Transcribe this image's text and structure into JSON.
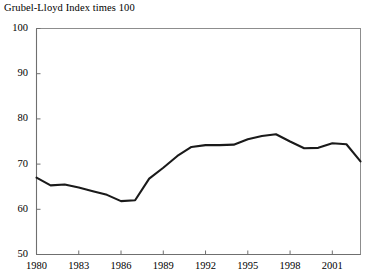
{
  "chart_data": {
    "type": "line",
    "title": "Grubel-Lloyd Index times 100",
    "xlabel": "",
    "ylabel": "",
    "grid": false,
    "legend": "none",
    "xlim": [
      1980,
      2003
    ],
    "ylim": [
      50,
      100
    ],
    "y_ticks": [
      50,
      60,
      70,
      80,
      90,
      100
    ],
    "y_tick_labels": [
      "50",
      "60",
      "70",
      "80",
      "90",
      "100"
    ],
    "x_ticks": [
      1980,
      1983,
      1986,
      1989,
      1992,
      1995,
      1998,
      2001
    ],
    "x_tick_labels": [
      "1980",
      "1983",
      "1986",
      "1989",
      "1992",
      "1995",
      "1998",
      "2001"
    ],
    "series": [
      {
        "name": "Grubel-Lloyd Index times 100",
        "color": "#1a1a1a",
        "x": [
          1980,
          1981,
          1982,
          1983,
          1984,
          1985,
          1986,
          1987,
          1988,
          1989,
          1990,
          1991,
          1992,
          1993,
          1994,
          1995,
          1996,
          1997,
          1998,
          1999,
          2000,
          2001,
          2002,
          2003
        ],
        "values": [
          67.0,
          65.3,
          65.5,
          64.8,
          64.0,
          63.2,
          61.8,
          62.0,
          66.8,
          69.2,
          71.8,
          73.8,
          74.2,
          74.2,
          74.3,
          75.5,
          76.2,
          76.6,
          75.0,
          73.5,
          73.6,
          74.6,
          74.4,
          70.6
        ]
      }
    ]
  },
  "axis_colors": {
    "frame": "#8d8d8d",
    "axis": "#6f6f6f",
    "series": "#1a1a1a"
  }
}
